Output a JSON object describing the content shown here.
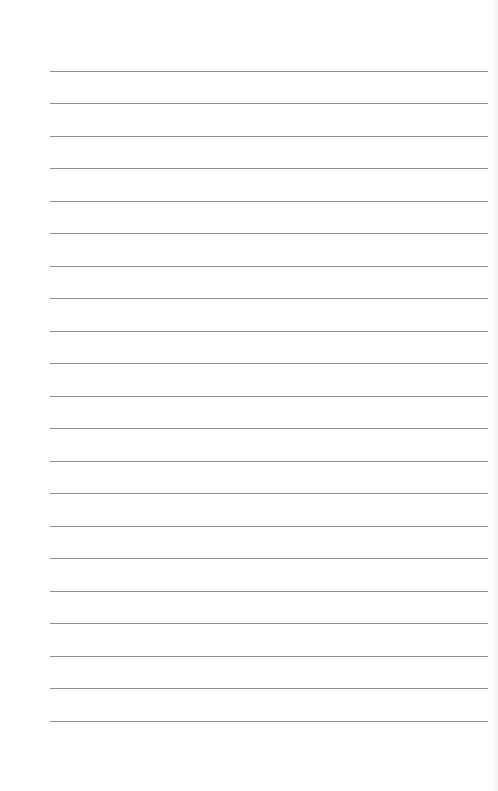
{
  "page": {
    "type": "lined-paper",
    "background": "#ffffff",
    "line_color": "#8f8f8f",
    "line_count": 21,
    "line_left": 50,
    "line_right": 488,
    "line_positions": [
      71,
      103,
      136,
      168,
      201,
      233,
      266,
      298,
      331,
      363,
      396,
      428,
      461,
      493,
      526,
      558,
      591,
      623,
      656,
      688,
      721
    ]
  }
}
